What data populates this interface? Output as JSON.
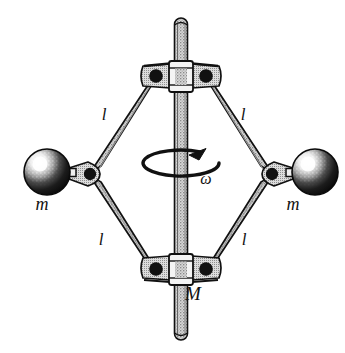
{
  "figure": {
    "name": "centrifugal-governor-diagram",
    "background_color": "#ffffff",
    "ink_color": "#111111",
    "metal_fill_color": "#c9c9c9",
    "sphere_fill_color": "#1a1a1a",
    "sphere_highlight_color": "#f2f2f2",
    "shaft": {
      "label": "",
      "description": "vertical rotating shaft",
      "top_y": 18,
      "bottom_y": 340,
      "center_x": 181,
      "width": 13
    },
    "labels": {
      "arm_upper_left": "l",
      "arm_upper_right": "l",
      "arm_lower_left": "l",
      "arm_lower_right": "l",
      "mass_left": "m",
      "mass_right": "m",
      "sliding_collar": "M",
      "angular_velocity": "ω"
    },
    "label_positions": {
      "arm_upper_left": {
        "x": 104,
        "y": 120
      },
      "arm_upper_right": {
        "x": 243,
        "y": 120
      },
      "arm_lower_left": {
        "x": 101,
        "y": 245
      },
      "arm_lower_right": {
        "x": 244,
        "y": 245
      },
      "mass_left": {
        "x": 42,
        "y": 210
      },
      "mass_right": {
        "x": 293,
        "y": 210
      },
      "sliding_collar": {
        "x": 193,
        "y": 300
      },
      "angular_velocity": {
        "x": 206,
        "y": 184
      }
    },
    "joints": {
      "top_hub": {
        "cx": 181,
        "cy": 75
      },
      "bottom_hub": {
        "cx": 181,
        "cy": 268
      },
      "left_knuckle": {
        "cx": 91,
        "cy": 174
      },
      "right_knuckle": {
        "cx": 271,
        "cy": 174
      }
    },
    "spheres": {
      "left": {
        "cx": 47,
        "cy": 172,
        "r": 23
      },
      "right": {
        "cx": 315,
        "cy": 172,
        "r": 23
      }
    },
    "rotation_arrow": {
      "name": "rotation-direction-arrow",
      "center_x": 181,
      "center_y": 163,
      "rx": 38,
      "ry": 13,
      "direction": "counterclockwise-viewed-from-above"
    }
  }
}
